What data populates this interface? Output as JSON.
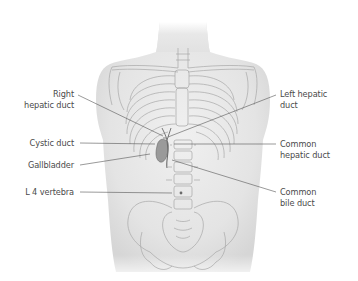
{
  "figure": {
    "colors": {
      "background": "#ffffff",
      "skin": "#e6e6e6",
      "skin_shadow": "#d2d2d2",
      "bone_line": "#a8a8a8",
      "duct_line": "#6a6a6a",
      "gallbladder": "#9a9a9a",
      "leader_line": "#555555",
      "label_text": "#4a4a4a"
    },
    "labels": {
      "right_hepatic_duct": {
        "line1": "Right",
        "line2": "hepatic duct"
      },
      "cystic_duct": {
        "line1": "Cystic duct"
      },
      "gallbladder": {
        "line1": "Gallbladder"
      },
      "l4_vertebra": {
        "line1": "L 4 vertebra"
      },
      "left_hepatic_duct": {
        "line1": "Left hepatic",
        "line2": "duct"
      },
      "common_hepatic_duct": {
        "line1": "Common",
        "line2": "hepatic duct"
      },
      "common_bile_duct": {
        "line1": "Common",
        "line2": "bile duct"
      }
    }
  }
}
